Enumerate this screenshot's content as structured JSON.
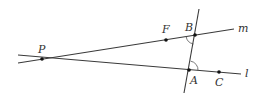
{
  "diagram": {
    "type": "geometry",
    "colors": {
      "line": "#3a3a3a",
      "point": "#111111",
      "label": "#333333",
      "background": "#ffffff"
    },
    "points": [
      {
        "id": "P",
        "label": "P",
        "x": 42,
        "y": 59,
        "label_x": 38,
        "label_y": 53
      },
      {
        "id": "F",
        "label": "F",
        "x": 166,
        "y": 40,
        "label_x": 162,
        "label_y": 33
      },
      {
        "id": "B",
        "label": "B",
        "x": 195,
        "y": 35,
        "label_x": 185,
        "label_y": 31
      },
      {
        "id": "A",
        "label": "A",
        "x": 189,
        "y": 70,
        "label_x": 190,
        "label_y": 84
      },
      {
        "id": "C",
        "label": "C",
        "x": 219,
        "y": 72,
        "label_x": 215,
        "label_y": 86
      }
    ],
    "lines": [
      {
        "id": "m",
        "label": "m",
        "x1": 18,
        "y1": 63,
        "x2": 234,
        "y2": 29,
        "label_x": 238,
        "label_y": 32
      },
      {
        "id": "l",
        "label": "l",
        "x1": 18,
        "y1": 55,
        "x2": 241,
        "y2": 74,
        "label_x": 245,
        "label_y": 77
      },
      {
        "id": "transversal",
        "label": "",
        "x1": 199,
        "y1": 9,
        "x2": 184,
        "y2": 93
      }
    ],
    "angle_marks": [
      {
        "at": "B",
        "description": "angle between line m (toward P) and transversal (toward A)"
      },
      {
        "at": "A",
        "description": "angle between transversal (toward B) and line l (toward C)"
      }
    ]
  }
}
